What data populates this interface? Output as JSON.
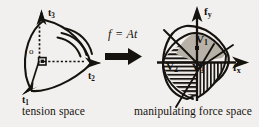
{
  "figure": {
    "background_color": "#f2f0ee",
    "ink_color": "#16130f",
    "shade_color": "#b9b2a8",
    "captions": {
      "left": "tension space",
      "right": "manipulating force space"
    },
    "equation": "f = At",
    "left_diagram": {
      "name": "tension-space-axes",
      "origin_label": "o",
      "axes": [
        {
          "id": "t1",
          "label": "t",
          "sub": "1"
        },
        {
          "id": "t2",
          "label": "t",
          "sub": "2"
        },
        {
          "id": "t3",
          "label": "t",
          "sub": "3"
        }
      ],
      "arc_count": 3,
      "right_angle_marker": true
    },
    "right_diagram": {
      "name": "manipulating-force-space",
      "axes": [
        {
          "id": "fy",
          "label": "f",
          "sub": "y",
          "direction": "up"
        },
        {
          "id": "fx",
          "label": "f",
          "sub": "x",
          "direction": "right"
        }
      ],
      "regions": [
        {
          "id": "V1",
          "label": "V",
          "sub": "1",
          "fill": "solid-gray"
        },
        {
          "id": "V2",
          "label": "V",
          "sub": "2",
          "fill": "horizontal-hatch"
        },
        {
          "id": "V3",
          "label": "V",
          "sub": "3",
          "fill": "vertical-hatch"
        }
      ]
    },
    "arrow": {
      "name": "mapping-arrow",
      "direction": "right"
    }
  }
}
